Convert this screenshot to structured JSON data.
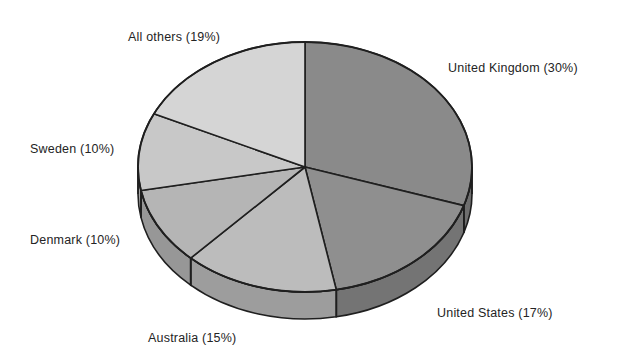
{
  "chart_data": {
    "type": "pie",
    "title": "",
    "subtitle": "",
    "xlabel": "",
    "ylabel": "",
    "grid": false,
    "legend_position": "none",
    "label_format": "{name} ({value}%)",
    "three_d": true,
    "start_angle_deg": 0,
    "direction": "clockwise",
    "categories": [
      "United Kingdom",
      "United States",
      "Australia",
      "Denmark",
      "Sweden",
      "All others"
    ],
    "values": [
      30,
      17,
      15,
      10,
      10,
      19
    ],
    "total": 101,
    "units": "percent",
    "slices": [
      {
        "name": "United Kingdom",
        "value": 30,
        "label": "United Kingdom (30%)",
        "color": "#8a8a8a",
        "side_color": "#6f6f6f",
        "start_angle": 0,
        "end_angle": 108
      },
      {
        "name": "United States",
        "value": 17,
        "label": "United States (17%)",
        "color": "#8f8f8f",
        "side_color": "#747474",
        "start_angle": 108,
        "end_angle": 169.2
      },
      {
        "name": "Australia",
        "value": 15,
        "label": "Australia (15%)",
        "color": "#bcbcbc",
        "side_color": "#9d9d9d",
        "start_angle": 169.2,
        "end_angle": 223.2
      },
      {
        "name": "Denmark",
        "value": 10,
        "label": "Denmark (10%)",
        "color": "#b5b5b5",
        "side_color": "#979797",
        "start_angle": 223.2,
        "end_angle": 259.2
      },
      {
        "name": "Sweden",
        "value": 10,
        "label": "Sweden (10%)",
        "color": "#c8c8c8",
        "side_color": "#a8a8a8",
        "start_angle": 259.2,
        "end_angle": 295.2
      },
      {
        "name": "All others",
        "value": 19,
        "label": "All others (19%)",
        "color": "#d5d5d5",
        "side_color": "#b3b3b3",
        "start_angle": 295.2,
        "end_angle": 360
      }
    ],
    "geometry": {
      "center_x": 305,
      "center_y": 167,
      "radius_x": 167,
      "radius_y": 125,
      "depth": 27,
      "outline_color": "#1f1f1f"
    }
  },
  "labels": {
    "all_others": "All others (19%)",
    "united_kingdom": "United Kingdom (30%)",
    "sweden": "Sweden (10%)",
    "denmark": "Denmark (10%)",
    "australia": "Australia (15%)",
    "united_states": "United States (17%)"
  }
}
